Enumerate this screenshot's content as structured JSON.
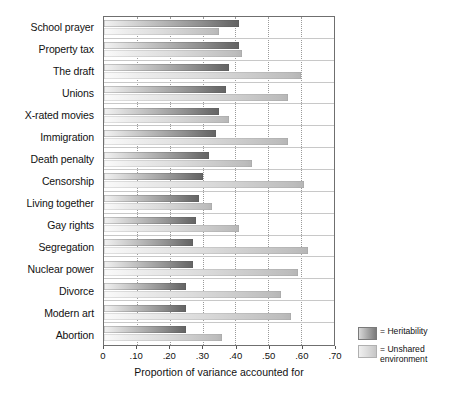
{
  "chart_data": {
    "type": "bar",
    "orientation": "horizontal",
    "title": "",
    "xlabel": "Proportion of variance accounted for",
    "ylabel": "",
    "xlim": [
      0,
      0.7
    ],
    "xticks": [
      "0",
      ".10",
      ".20",
      ".30",
      ".40",
      ".50",
      ".60",
      ".70"
    ],
    "xtick_values": [
      0,
      0.1,
      0.2,
      0.3,
      0.4,
      0.5,
      0.6,
      0.7
    ],
    "grid": true,
    "legend_position": "bottom-right",
    "categories": [
      "School prayer",
      "Property tax",
      "The draft",
      "Unions",
      "X-rated movies",
      "Immigration",
      "Death penalty",
      "Censorship",
      "Living together",
      "Gay rights",
      "Segregation",
      "Nuclear power",
      "Divorce",
      "Modern art",
      "Abortion"
    ],
    "series": [
      {
        "name": "Heritability",
        "legend_label": "= Heritability",
        "color": "#7a7a7a",
        "values": [
          0.41,
          0.41,
          0.38,
          0.37,
          0.35,
          0.34,
          0.32,
          0.3,
          0.29,
          0.28,
          0.27,
          0.27,
          0.25,
          0.25,
          0.25
        ]
      },
      {
        "name": "Unshared environment",
        "legend_label": "= Unshared environment",
        "color": "#c6c6c6",
        "values": [
          0.35,
          0.42,
          0.6,
          0.56,
          0.38,
          0.56,
          0.45,
          0.61,
          0.33,
          0.41,
          0.62,
          0.59,
          0.54,
          0.57,
          0.36
        ]
      }
    ]
  },
  "legend": {
    "items": [
      {
        "label": "= Heritability"
      },
      {
        "label_line1": "= Unshared",
        "label_line2": "environment"
      }
    ]
  }
}
